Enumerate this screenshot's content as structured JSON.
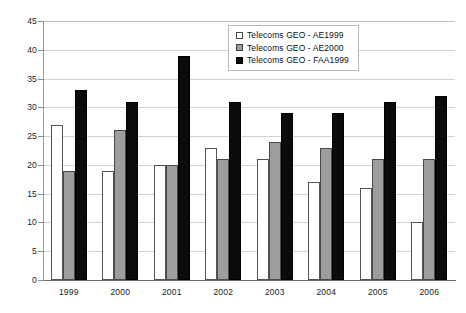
{
  "chart_data": {
    "type": "bar",
    "title": "",
    "subtitle": "",
    "xlabel": "",
    "ylabel": "",
    "categories": [
      "1999",
      "2000",
      "2001",
      "2002",
      "2003",
      "2004",
      "2005",
      "2006"
    ],
    "series": [
      {
        "name": "Telecoms GEO - AE1999",
        "color": "#ffffff",
        "values": [
          27,
          19,
          20,
          23,
          21,
          17,
          16,
          10
        ]
      },
      {
        "name": "Telecoms GEO - AE2000",
        "color": "#9d9d9d",
        "values": [
          19,
          26,
          20,
          21,
          24,
          23,
          21,
          21
        ]
      },
      {
        "name": "Telecoms GEO - FAA1999",
        "color": "#0b0b0b",
        "values": [
          33,
          31,
          39,
          31,
          29,
          29,
          31,
          32
        ]
      }
    ],
    "ylim": [
      0,
      45
    ],
    "ytick_values": [
      0,
      5,
      10,
      15,
      20,
      25,
      30,
      35,
      40,
      45
    ],
    "ytick_labels": [
      "0",
      "5",
      "10",
      "15",
      "20",
      "25",
      "30",
      "35",
      "40",
      "45"
    ],
    "grid": true,
    "grid_axis": "y",
    "legend_position": "top-center-right",
    "legend_entries": [
      "Telecoms GEO - AE1999",
      "Telecoms GEO - AE2000",
      "Telecoms GEO - FAA1999"
    ]
  }
}
